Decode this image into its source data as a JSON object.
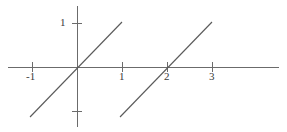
{
  "figure": {
    "width": 287,
    "height": 132,
    "background": "#ffffff",
    "line_color": "#5a5a5a",
    "axis_color": "#6b6b6b",
    "label_color": "#3a3a3a"
  },
  "axes": {
    "origin_px": {
      "x": 77,
      "y": 67
    },
    "x_unit_px": 45,
    "y_unit_px": 44,
    "x_axis": {
      "x_start_px": 8,
      "x_end_px": 279,
      "y_px": 67
    },
    "y_axis": {
      "y_start_px": 6,
      "y_end_px": 127,
      "x_px": 77
    },
    "grid": false,
    "legend": "none"
  },
  "ticks": {
    "x": [
      {
        "value": -1,
        "label": "-1",
        "px": 32,
        "label_x": 26,
        "label_y": 71
      },
      {
        "value": 1,
        "label": "1",
        "px": 122,
        "label_x": 119,
        "label_y": 71
      },
      {
        "value": 2,
        "label": "2",
        "px": 167,
        "label_x": 164,
        "label_y": 71
      },
      {
        "value": 3,
        "label": "3",
        "px": 212,
        "label_x": 209,
        "label_y": 71
      }
    ],
    "y": [
      {
        "value": 1,
        "label": "1",
        "px": 23,
        "label_x": 60,
        "label_y": 17
      },
      {
        "value": -1,
        "label": "",
        "px": 111,
        "label_x": 0,
        "label_y": 0
      }
    ]
  },
  "chart_data": {
    "type": "line",
    "title": "",
    "subtitle": "",
    "xlabel": "",
    "ylabel": "",
    "xlim": [
      -1.55,
      4.5
    ],
    "ylim": [
      -1.4,
      1.4
    ],
    "grid": false,
    "legend_position": "none",
    "x_ticks": [
      -1,
      1,
      2,
      3
    ],
    "x_tick_labels": [
      "-1",
      "1",
      "2",
      "3"
    ],
    "y_ticks": [
      1,
      -1
    ],
    "y_tick_labels": [
      "1",
      ""
    ],
    "annotations": [],
    "series": [
      {
        "name": "y = x",
        "equation": "y = x",
        "slope": 1,
        "intercept": 0,
        "x": [
          -1.05,
          1.0
        ],
        "y": [
          -1.14,
          1.02
        ],
        "points_px": [
          {
            "x": 30,
            "y": 117
          },
          {
            "x": 122,
            "y": 22
          }
        ],
        "color": "#5a5a5a"
      },
      {
        "name": "y = x - 2",
        "equation": "y = x - 2",
        "slope": 1,
        "intercept": -2,
        "x": [
          0.96,
          3.0
        ],
        "y": [
          -1.14,
          1.02
        ],
        "points_px": [
          {
            "x": 120,
            "y": 117
          },
          {
            "x": 212,
            "y": 22
          }
        ],
        "color": "#5a5a5a"
      }
    ]
  }
}
